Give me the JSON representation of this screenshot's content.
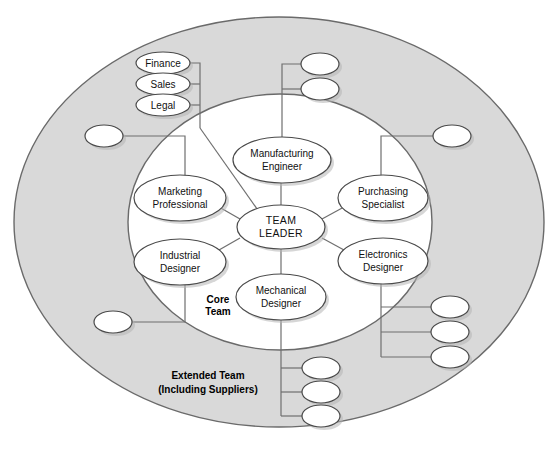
{
  "figure": {
    "type": "concentric-team-structure-diagram",
    "background_color": "#ffffff",
    "extended_band_color": "#d9d9d9",
    "core_fill_color": "#ffffff",
    "node_fill_color": "#ffffff",
    "outline_color": "#6a6a6a",
    "connector_color": "#6f6f6f"
  },
  "zones": {
    "core": {
      "label_line1": "Core",
      "label_line2": "Team",
      "cx": 280,
      "cy": 222,
      "rx": 152,
      "ry": 128,
      "label_x": 218,
      "label_y1": 300,
      "label_y2": 312
    },
    "extended": {
      "label_line1": "Extended Team",
      "label_line2": "(Including Suppliers)",
      "cx": 279,
      "cy": 222,
      "rx": 265,
      "ry": 205,
      "label_x": 208,
      "label_y1": 376,
      "label_y2": 390
    }
  },
  "core_nodes": [
    {
      "id": "team-leader",
      "line1": "TEAM",
      "line2": "LEADER",
      "cx": 281,
      "cy": 227,
      "rx": 44,
      "ry": 22,
      "style": "leader"
    },
    {
      "id": "manufacturing-engineer",
      "line1": "Manufacturing",
      "line2": "Engineer",
      "cx": 282,
      "cy": 160,
      "rx": 49,
      "ry": 23,
      "style": "normal"
    },
    {
      "id": "marketing-professional",
      "line1": "Marketing",
      "line2": "Professional",
      "cx": 180,
      "cy": 198,
      "rx": 46,
      "ry": 23,
      "style": "normal"
    },
    {
      "id": "purchasing-specialist",
      "line1": "Purchasing",
      "line2": "Specialist",
      "cx": 383,
      "cy": 198,
      "rx": 45,
      "ry": 23,
      "style": "normal"
    },
    {
      "id": "industrial-designer",
      "line1": "Industrial",
      "line2": "Designer",
      "cx": 180,
      "cy": 262,
      "rx": 46,
      "ry": 23,
      "style": "normal"
    },
    {
      "id": "electronics-designer",
      "line1": "Electronics",
      "line2": "Designer",
      "cx": 383,
      "cy": 261,
      "rx": 45,
      "ry": 23,
      "style": "normal"
    },
    {
      "id": "mechanical-designer",
      "line1": "Mechanical",
      "line2": "Designer",
      "cx": 281,
      "cy": 297,
      "rx": 45,
      "ry": 23,
      "style": "normal"
    }
  ],
  "labeled_extended_nodes": [
    {
      "id": "finance",
      "label": "Finance",
      "cx": 163,
      "cy": 63,
      "rx": 27,
      "ry": 11
    },
    {
      "id": "sales",
      "label": "Sales",
      "cx": 163,
      "cy": 84,
      "rx": 27,
      "ry": 11
    },
    {
      "id": "legal",
      "label": "Legal",
      "cx": 163,
      "cy": 105,
      "rx": 27,
      "ry": 11
    }
  ],
  "unlabeled_extended_nodes": [
    {
      "id": "supplier-top-1",
      "label": "",
      "cx": 320,
      "cy": 64,
      "rx": 19,
      "ry": 11
    },
    {
      "id": "supplier-top-2",
      "label": "",
      "cx": 320,
      "cy": 89,
      "rx": 19,
      "ry": 11
    },
    {
      "id": "supplier-left-1",
      "label": "",
      "cx": 104,
      "cy": 136,
      "rx": 19,
      "ry": 11
    },
    {
      "id": "supplier-right-1",
      "label": "",
      "cx": 452,
      "cy": 136,
      "rx": 19,
      "ry": 11
    },
    {
      "id": "supplier-left-2",
      "label": "",
      "cx": 113,
      "cy": 322,
      "rx": 19,
      "ry": 11
    },
    {
      "id": "supplier-right-2",
      "label": "",
      "cx": 450,
      "cy": 307,
      "rx": 19,
      "ry": 11
    },
    {
      "id": "supplier-right-3",
      "label": "",
      "cx": 450,
      "cy": 332,
      "rx": 19,
      "ry": 11
    },
    {
      "id": "supplier-right-4",
      "label": "",
      "cx": 450,
      "cy": 357,
      "rx": 19,
      "ry": 11
    },
    {
      "id": "supplier-bottom-1",
      "label": "",
      "cx": 321,
      "cy": 368,
      "rx": 19,
      "ry": 11
    },
    {
      "id": "supplier-bottom-2",
      "label": "",
      "cx": 321,
      "cy": 392,
      "rx": 19,
      "ry": 11
    },
    {
      "id": "supplier-bottom-3",
      "label": "",
      "cx": 321,
      "cy": 416,
      "rx": 19,
      "ry": 11
    }
  ],
  "connectors": [
    {
      "id": "spoke-leader-manufacturing",
      "d": "M 281 205 L 281 183"
    },
    {
      "id": "spoke-leader-marketing",
      "d": "M 240 219 L 219 207"
    },
    {
      "id": "spoke-leader-purchasing",
      "d": "M 322 219 L 344 207"
    },
    {
      "id": "spoke-leader-industrial",
      "d": "M 240 238 L 219 250"
    },
    {
      "id": "spoke-leader-electronics",
      "d": "M 322 238 L 344 250"
    },
    {
      "id": "spoke-leader-mechanical",
      "d": "M 281 249 L 281 274"
    },
    {
      "id": "bus-finance",
      "d": "M 190 63 L 200 63 L 200 128"
    },
    {
      "id": "bus-sales",
      "d": "M 190 84 L 200 84"
    },
    {
      "id": "bus-legal",
      "d": "M 190 105 L 200 105"
    },
    {
      "id": "bus-admin-to-leader",
      "d": "M 200 128 L 262 216"
    },
    {
      "id": "bus-top-1",
      "d": "M 301 64 L 282 64 L 282 137"
    },
    {
      "id": "bus-top-2",
      "d": "M 301 89 L 282 89"
    },
    {
      "id": "bus-left-marketing",
      "d": "M 123 136 L 185 136 L 185 177"
    },
    {
      "id": "bus-left-industrial",
      "d": "M 132 322 L 185 322 L 185 284"
    },
    {
      "id": "bus-right-purchasing",
      "d": "M 433 136 L 381 136 L 381 177"
    },
    {
      "id": "bus-right-electronics-trunk",
      "d": "M 381 284 L 381 357"
    },
    {
      "id": "bus-right-branch-1",
      "d": "M 381 307 L 431 307"
    },
    {
      "id": "bus-right-branch-2",
      "d": "M 381 332 L 431 332"
    },
    {
      "id": "bus-right-branch-3",
      "d": "M 381 357 L 431 357"
    },
    {
      "id": "bus-bottom-trunk",
      "d": "M 281 320 L 281 416"
    },
    {
      "id": "bus-bottom-branch-1",
      "d": "M 281 368 L 302 368"
    },
    {
      "id": "bus-bottom-branch-2",
      "d": "M 281 392 L 302 392"
    },
    {
      "id": "bus-bottom-branch-3",
      "d": "M 281 416 L 302 416"
    }
  ]
}
